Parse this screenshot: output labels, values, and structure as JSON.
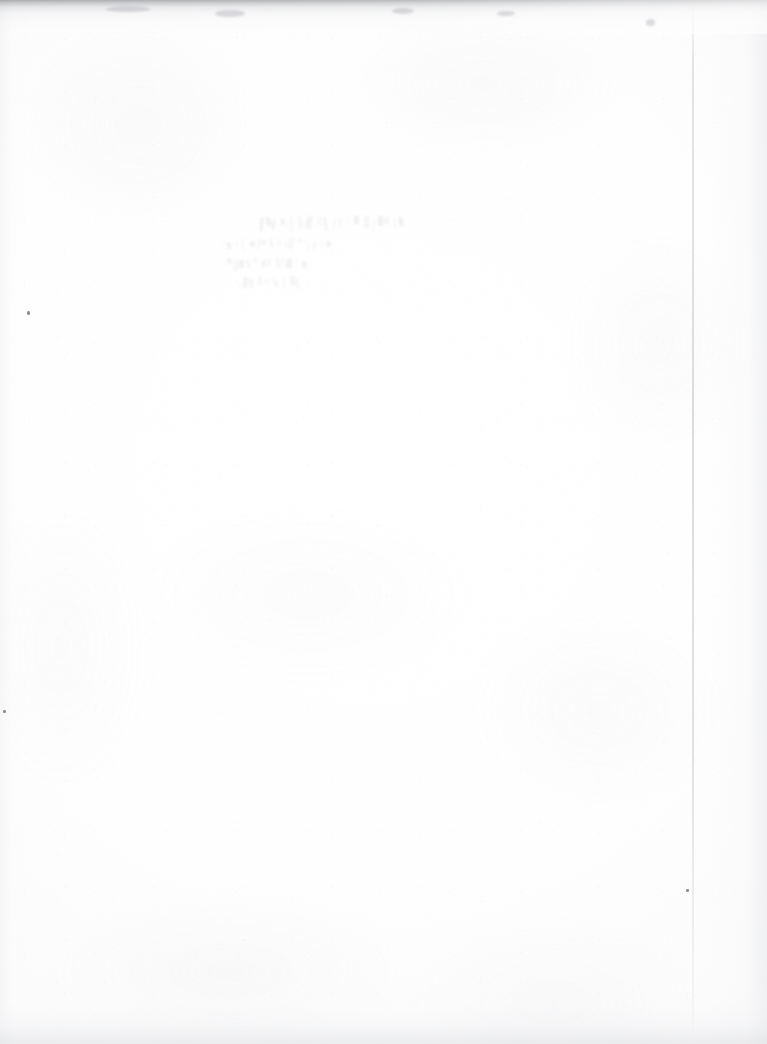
{
  "document": {
    "kind": "scanned-book-page",
    "appearance": "blank",
    "page_width": 767,
    "page_height": 1044,
    "paper_color": "#fdfdfd",
    "paper_tone_edge": "#f2f2f3",
    "scan_top_shadow_color": "#787a7e",
    "crease_line_color": "#c8c9cf",
    "speck_color": "#8e8d95"
  },
  "ghost_text": {
    "description": "faint show-through impression of printing from the reverse side of the leaf; reversed and illegible",
    "ink_color": "#5d5a63",
    "opacity": "0.085",
    "left": 278,
    "top": 214,
    "lines": [
      {
        "text": "                        ",
        "size": 15,
        "indent": 0,
        "spacing": 1.0
      },
      {
        "text": "                    ",
        "size": 13,
        "indent": 36,
        "spacing": 1.2
      },
      {
        "text": "              ",
        "size": 12,
        "indent": 48,
        "spacing": 1.0
      },
      {
        "text": "          ",
        "size": 12,
        "indent": 52,
        "spacing": 1.0
      }
    ]
  },
  "marks": {
    "crease_x": 692,
    "specks": [
      {
        "x": 27,
        "y": 311,
        "w": 3,
        "h": 4
      },
      {
        "x": 3,
        "y": 710,
        "w": 3,
        "h": 3
      },
      {
        "x": 686,
        "y": 889,
        "w": 3,
        "h": 3
      }
    ],
    "soft_marks": [
      {
        "x": 215,
        "y": 10,
        "w": 30,
        "h": 7
      },
      {
        "x": 392,
        "y": 8,
        "w": 22,
        "h": 6
      },
      {
        "x": 646,
        "y": 19,
        "w": 9,
        "h": 7
      },
      {
        "x": 106,
        "y": 6,
        "w": 44,
        "h": 6
      },
      {
        "x": 497,
        "y": 11,
        "w": 18,
        "h": 5
      }
    ]
  }
}
